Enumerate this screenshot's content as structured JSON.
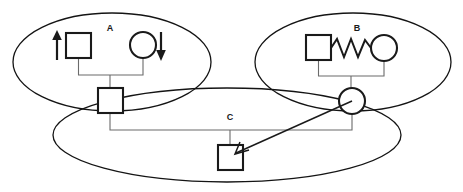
{
  "diagram": {
    "type": "pedigree-diagram",
    "width": 463,
    "height": 192,
    "background_color": "#ffffff",
    "stroke_color": "#1a1a1a",
    "connector_color": "#6b6b6b",
    "groups": [
      {
        "id": "group-a",
        "label": "A",
        "label_x": 110,
        "label_y": 29,
        "ellipse": {
          "cx": 112,
          "cy": 62,
          "rx": 99,
          "ry": 49
        },
        "members": [
          {
            "kind": "square",
            "role": "male",
            "x": 66,
            "y": 33,
            "size": 25,
            "annotation": "up-arrow"
          },
          {
            "kind": "circle",
            "role": "female",
            "cx": 143,
            "cy": 45,
            "r": 13,
            "annotation": "down-arrow"
          }
        ]
      },
      {
        "id": "group-b",
        "label": "B",
        "label_x": 357,
        "label_y": 29,
        "ellipse": {
          "cx": 353,
          "cy": 62,
          "rx": 98,
          "ry": 49
        },
        "members": [
          {
            "kind": "square",
            "role": "male",
            "x": 306,
            "y": 35,
            "size": 25,
            "annotation": "none"
          },
          {
            "kind": "circle",
            "role": "female",
            "cx": 384,
            "cy": 48,
            "r": 13,
            "annotation": "none"
          }
        ],
        "connector": "spring"
      },
      {
        "id": "group-c",
        "label": "C",
        "label_x": 230,
        "label_y": 118,
        "ellipse": {
          "cx": 227,
          "cy": 135,
          "rx": 174,
          "ry": 47
        },
        "members": [
          {
            "kind": "square",
            "role": "male",
            "x": 98,
            "y": 88,
            "size": 25,
            "annotation": "none"
          },
          {
            "kind": "circle",
            "role": "female",
            "cx": 352,
            "cy": 101,
            "r": 13,
            "annotation": "none"
          },
          {
            "kind": "square",
            "role": "male",
            "x": 218,
            "y": 145,
            "size": 25,
            "annotation": "arrow-target"
          }
        ]
      }
    ],
    "annotations": {
      "up_arrow": {
        "x": 57,
        "y_top": 32,
        "y_bottom": 60,
        "direction": "up"
      },
      "down_arrow": {
        "x": 161,
        "y_top": 32,
        "y_bottom": 60,
        "direction": "down"
      },
      "pointer": {
        "from_x": 352,
        "from_y": 101,
        "to_x": 238,
        "to_y": 152,
        "description": "arrow-from-circle-to-square"
      }
    },
    "connectors": {
      "couple_a_y": 75,
      "couple_b_y": 76,
      "sibship_y": 130,
      "sibship_x_start": 110,
      "sibship_x_end": 352,
      "sibship_child_x": 230
    }
  }
}
